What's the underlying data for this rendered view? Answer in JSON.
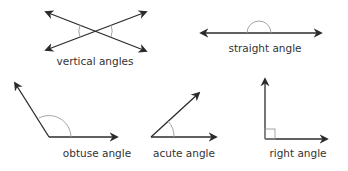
{
  "colors": {
    "line": "#2b2b2b",
    "arc": "#9a9a9a",
    "text": "#333333",
    "background": "#ffffff"
  },
  "figures": [
    {
      "id": "vertical",
      "label": "vertical angles"
    },
    {
      "id": "straight",
      "label": "straight angle"
    },
    {
      "id": "obtuse",
      "label": "obtuse angle"
    },
    {
      "id": "acute",
      "label": "acute angle"
    },
    {
      "id": "right",
      "label": "right angle"
    }
  ]
}
